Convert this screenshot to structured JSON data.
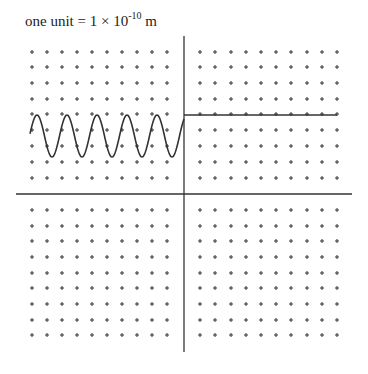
{
  "caption": {
    "prefix": "one unit = 1 × 10",
    "exponent": "-10",
    "suffix": " m"
  },
  "diagram": {
    "type": "wave-at-barrier",
    "axes": {
      "x_axis": {
        "y": 194,
        "x1": 16,
        "x2": 352
      },
      "y_axis": {
        "x": 184,
        "y1": 36,
        "y2": 352
      },
      "color": "#333333"
    },
    "grid": {
      "marker": "+",
      "left_columns": [
        32,
        47,
        62,
        77,
        92,
        107,
        122,
        137,
        152,
        167
      ],
      "right_columns": [
        200,
        215,
        231,
        246,
        261,
        276,
        291,
        307,
        322,
        337
      ],
      "top_rows": [
        52,
        67,
        83,
        99,
        114,
        130,
        146,
        162,
        178
      ],
      "bottom_rows": [
        210,
        226,
        241,
        257,
        273,
        288,
        304,
        320,
        335
      ],
      "color": "#333333"
    },
    "wave": {
      "description": "oscillating wave in left region",
      "x_start": 30,
      "x_end": 184,
      "center_y": 136,
      "amplitude": 21,
      "period": 30,
      "peak_x": 37,
      "color": "#333333"
    },
    "flat_line": {
      "description": "constant line in right region",
      "y": 115,
      "x1": 184,
      "x2": 337
    }
  }
}
